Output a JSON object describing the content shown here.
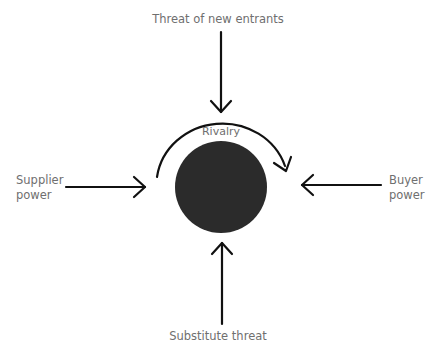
{
  "diagram": {
    "type": "five-forces",
    "colors": {
      "background": "#ffffff",
      "arrow": "#111111",
      "core_circle": "#2b2b2b",
      "label_text": "#6f6f6f"
    },
    "center": {
      "label": "Rivalry"
    },
    "forces": {
      "top": {
        "label": "Threat of new entrants"
      },
      "left": {
        "label_line1": "Supplier",
        "label_line2": "power"
      },
      "right": {
        "label_line1": "Buyer",
        "label_line2": "power"
      },
      "bottom": {
        "label": "Substitute threat"
      }
    }
  }
}
